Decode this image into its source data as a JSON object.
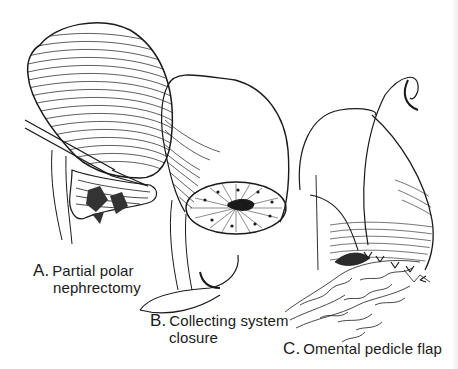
{
  "figure": {
    "panels": [
      {
        "id": "A",
        "letter": "A.",
        "caption_line1": "Partial polar",
        "caption_line2": "nephrectomy",
        "description": "Kidney with scalpel excising lower pole"
      },
      {
        "id": "B",
        "letter": "B.",
        "caption_line1": "Collecting system",
        "caption_line2": "closure",
        "description": "Cut surface of kidney with sutured collecting system and curved needle"
      },
      {
        "id": "C",
        "letter": "C.",
        "caption_line1": "Omental pedicle flap",
        "caption_line2": "",
        "description": "Omentum sutured over cut surface of kidney with needle"
      }
    ],
    "colors": {
      "ink": "#1a1a1a",
      "background": "#ffffff"
    }
  }
}
